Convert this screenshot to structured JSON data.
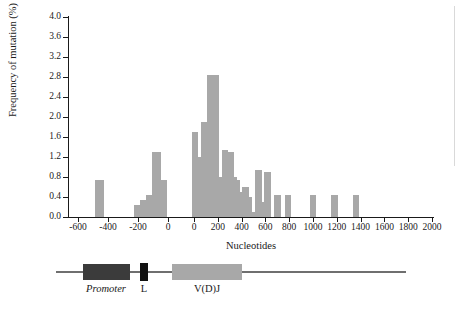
{
  "chart_data": {
    "type": "bar",
    "title": "",
    "xlabel": "Nucleotides",
    "ylabel": "Frequency of mutation (%)",
    "ylim": [
      0.0,
      4.0
    ],
    "ytick_labels": [
      "4.0",
      "3.6",
      "3.2",
      "2.8",
      "2.4",
      "2.0",
      "1.6",
      "1.2",
      "0.8",
      "0.4",
      "0.0"
    ],
    "ytick_values": [
      4.0,
      3.6,
      3.2,
      2.8,
      2.4,
      2.0,
      1.6,
      1.2,
      0.8,
      0.4,
      0.0
    ],
    "grid": false,
    "legend": "none",
    "axis_break": true,
    "axis_break_note": "x-axis is broken near the centre: the left segment runs -600 to 0 (upstream promoter coordinates) and the right segment restarts at 0 and runs to 2000 (V(D)J coordinates)",
    "xtick_labels_left": [
      "-600",
      "-400",
      "-200",
      "0"
    ],
    "xtick_labels_right": [
      "0",
      "200",
      "400",
      "600",
      "800",
      "1000",
      "1200",
      "1400",
      "1600",
      "1800",
      "2000"
    ],
    "xtick_values_left": [
      -600,
      -400,
      -200,
      0
    ],
    "xtick_values_right": [
      0,
      200,
      400,
      600,
      800,
      1000,
      1200,
      1400,
      1600,
      1800,
      2000
    ],
    "bar_color": "#a8a8a8",
    "bars_left": [
      {
        "x": -460,
        "value": 0.75
      },
      {
        "x": -200,
        "value": 0.25
      },
      {
        "x": -160,
        "value": 0.35
      },
      {
        "x": -120,
        "value": 0.45
      },
      {
        "x": -80,
        "value": 1.3
      },
      {
        "x": -40,
        "value": 0.75
      }
    ],
    "bars_right": [
      {
        "x": 10,
        "value": 1.7
      },
      {
        "x": 35,
        "value": 0.8
      },
      {
        "x": 60,
        "value": 1.2
      },
      {
        "x": 85,
        "value": 1.9
      },
      {
        "x": 110,
        "value": 1.6
      },
      {
        "x": 135,
        "value": 2.85
      },
      {
        "x": 160,
        "value": 2.4
      },
      {
        "x": 185,
        "value": 2.85
      },
      {
        "x": 210,
        "value": 0.8
      },
      {
        "x": 235,
        "value": 0.7
      },
      {
        "x": 260,
        "value": 1.35
      },
      {
        "x": 285,
        "value": 1.05
      },
      {
        "x": 310,
        "value": 1.3
      },
      {
        "x": 335,
        "value": 0.8
      },
      {
        "x": 360,
        "value": 0.75
      },
      {
        "x": 385,
        "value": 0.5
      },
      {
        "x": 410,
        "value": 0.2
      },
      {
        "x": 435,
        "value": 0.6
      },
      {
        "x": 460,
        "value": 0.4
      },
      {
        "x": 500,
        "value": 0.1
      },
      {
        "x": 540,
        "value": 0.95
      },
      {
        "x": 580,
        "value": 0.3
      },
      {
        "x": 620,
        "value": 0.9
      },
      {
        "x": 700,
        "value": 0.45
      },
      {
        "x": 790,
        "value": 0.45
      },
      {
        "x": 1000,
        "value": 0.45
      },
      {
        "x": 1180,
        "value": 0.45
      },
      {
        "x": 1360,
        "value": 0.45
      }
    ]
  },
  "gene_map": {
    "promoter_label": "Promoter",
    "leader_label": "L",
    "vdj_label": "V(D)J",
    "promoter_color": "#3b3b3b",
    "leader_color": "#111111",
    "vdj_color": "#a8a8a8",
    "backbone_color": "#6f6f6f"
  }
}
